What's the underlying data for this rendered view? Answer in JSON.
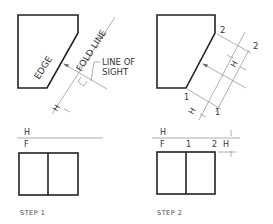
{
  "figure": {
    "panels": [
      {
        "id": "step1",
        "caption": "STEP 1",
        "labels": {
          "edge": "EDGE",
          "fold_line": "FOLD LINE",
          "line_of_sight_1": "LINE OF",
          "line_of_sight_2": "SIGHT",
          "h_marker": "H",
          "fold_tick": "1",
          "h_top": "H",
          "f_bottom": "F"
        }
      },
      {
        "id": "step2",
        "caption": "STEP 2",
        "labels": {
          "point_2_top": "2",
          "point_2_aux": "2",
          "point_1_top": "1",
          "point_1_aux": "1",
          "h_dim_aux": "H",
          "h_marker": "H",
          "h_top": "H",
          "f_bottom": "F",
          "front_1": "1",
          "front_2": "2",
          "h_dim_front": "H"
        }
      }
    ],
    "colors": {
      "object_line": "#222222",
      "construction_line": "#9a9a9a",
      "text": "#333333"
    }
  }
}
